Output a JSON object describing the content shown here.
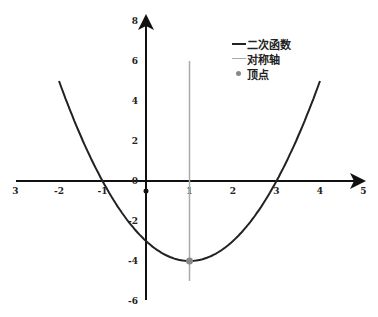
{
  "chart_data": {
    "type": "line",
    "title": "",
    "xlabel": "",
    "ylabel": "",
    "xlim": [
      -3,
      5
    ],
    "ylim": [
      -6,
      8
    ],
    "grid": false,
    "legend_position": "upper right",
    "x_tick_labels": [
      "3",
      "-2",
      "-1",
      "0",
      "1",
      "2",
      "3",
      "4",
      "5"
    ],
    "y_tick_labels": [
      "8",
      "6",
      "4",
      "2",
      "0",
      "-2",
      "-4",
      "-6"
    ],
    "series": [
      {
        "name": "二次函数",
        "kind": "curve",
        "color": "#222222",
        "equation": "y = x^2 - 2x - 3",
        "x": [
          -2,
          -1.5,
          -1,
          -0.5,
          0,
          0.5,
          1,
          1.5,
          2,
          2.5,
          3,
          3.5,
          4
        ],
        "y": [
          5,
          2.25,
          0,
          -1.75,
          -3,
          -3.75,
          -4,
          -3.75,
          -3,
          -1.75,
          0,
          2.25,
          5
        ]
      },
      {
        "name": "对称轴",
        "kind": "vertical-line",
        "color": "#aaaaaa",
        "x": [
          1,
          1
        ],
        "y": [
          -5,
          6
        ]
      },
      {
        "name": "顶点",
        "kind": "point",
        "color": "#888888",
        "x": [
          1
        ],
        "y": [
          -4
        ]
      }
    ],
    "annotations": [
      {
        "text": "origin marker",
        "x": 0,
        "y": -0.3
      }
    ]
  },
  "legend": {
    "items": [
      {
        "label": "二次函数",
        "color": "#222222",
        "type": "line"
      },
      {
        "label": "对称轴",
        "color": "#aaaaaa",
        "type": "line"
      },
      {
        "label": "顶点",
        "color": "#888888",
        "type": "dot"
      }
    ]
  }
}
